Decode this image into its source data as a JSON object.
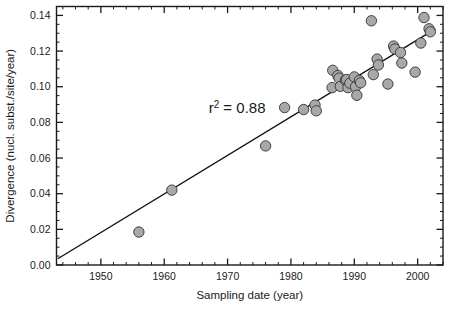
{
  "chart_data": {
    "type": "scatter",
    "title": "",
    "xlabel": "Sampling date (year)",
    "ylabel": "Divergence (nucl. subst./site/year)",
    "xlim": [
      1943,
      2004
    ],
    "ylim": [
      0.0,
      0.145
    ],
    "grid": false,
    "legend": null,
    "xticks": [
      1950,
      1960,
      1970,
      1980,
      1990,
      2000
    ],
    "xtick_labels": [
      "1950",
      "1960",
      "1970",
      "1980",
      "1990",
      "2000"
    ],
    "xtick_minor_step": 2,
    "yticks": [
      0.0,
      0.02,
      0.04,
      0.06,
      0.08,
      0.1,
      0.12,
      0.14
    ],
    "ytick_labels": [
      "0.00",
      "0.02",
      "0.04",
      "0.06",
      "0.08",
      "0.10",
      "0.12",
      "0.14"
    ],
    "ytick_minor_step": 0.005,
    "annotations": [
      {
        "name": "r-squared",
        "text_main": "r",
        "text_sup": "2",
        "text_tail": " = 0.88",
        "x": 1971.5,
        "y": 0.0855
      }
    ],
    "trendline": {
      "name": "linear-regression-line",
      "x_start": 1943.2,
      "y_start": 0.0035,
      "x_end": 2002.8,
      "y_end": 0.1325,
      "r_squared": 0.88
    },
    "marker": {
      "shape": "circle",
      "radius_px": 5.2,
      "fill": "#a8a8a8",
      "stroke": "#333333"
    },
    "points": [
      {
        "x": 1956.0,
        "y": 0.0185
      },
      {
        "x": 1961.2,
        "y": 0.042
      },
      {
        "x": 1976.0,
        "y": 0.0668
      },
      {
        "x": 1979.0,
        "y": 0.0883
      },
      {
        "x": 1982.0,
        "y": 0.0872
      },
      {
        "x": 1983.8,
        "y": 0.0897
      },
      {
        "x": 1984.0,
        "y": 0.0865
      },
      {
        "x": 1986.6,
        "y": 0.1092
      },
      {
        "x": 1986.5,
        "y": 0.0995
      },
      {
        "x": 1987.4,
        "y": 0.1063
      },
      {
        "x": 1987.6,
        "y": 0.1048
      },
      {
        "x": 1987.8,
        "y": 0.1002
      },
      {
        "x": 1988.6,
        "y": 0.1037
      },
      {
        "x": 1988.8,
        "y": 0.104
      },
      {
        "x": 1989.0,
        "y": 0.0995
      },
      {
        "x": 1989.3,
        "y": 0.102
      },
      {
        "x": 1990.0,
        "y": 0.1055
      },
      {
        "x": 1990.2,
        "y": 0.1
      },
      {
        "x": 1990.4,
        "y": 0.0952
      },
      {
        "x": 1990.8,
        "y": 0.1035
      },
      {
        "x": 1991.0,
        "y": 0.1022
      },
      {
        "x": 1992.7,
        "y": 0.137
      },
      {
        "x": 1993.0,
        "y": 0.1068
      },
      {
        "x": 1993.6,
        "y": 0.1155
      },
      {
        "x": 1993.8,
        "y": 0.1122
      },
      {
        "x": 1995.3,
        "y": 0.1015
      },
      {
        "x": 1996.2,
        "y": 0.1228
      },
      {
        "x": 1996.4,
        "y": 0.1212
      },
      {
        "x": 1997.3,
        "y": 0.1192
      },
      {
        "x": 1997.5,
        "y": 0.1133
      },
      {
        "x": 1999.6,
        "y": 0.1082
      },
      {
        "x": 2000.5,
        "y": 0.1245
      },
      {
        "x": 2001.0,
        "y": 0.1388
      },
      {
        "x": 2001.8,
        "y": 0.1325
      },
      {
        "x": 2002.0,
        "y": 0.1308
      }
    ]
  }
}
